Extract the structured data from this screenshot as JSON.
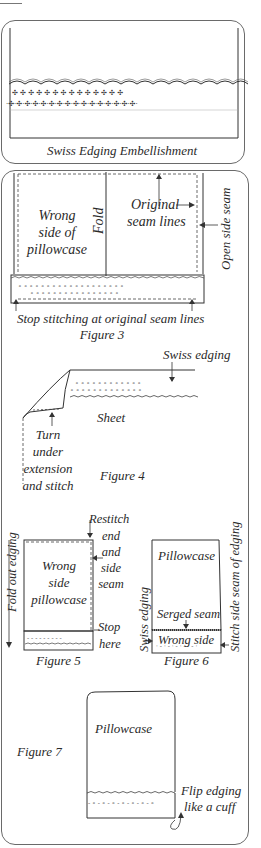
{
  "panel1": {
    "caption": "Swiss Edging Embellishment"
  },
  "figure3": {
    "label_wrong_side": "Wrong\nside of\npillowcase",
    "label_fold": "Fold",
    "label_original": "Original",
    "label_seam_lines": "seam lines",
    "label_open_side_seam": "Open side seam",
    "label_stop_stitching": "Stop stitching at original seam lines",
    "caption": "Figure 3"
  },
  "figure4": {
    "label_swiss_edging": "Swiss edging",
    "label_sheet": "Sheet",
    "label_turn": "Turn",
    "label_under": "under",
    "label_extension": "extension",
    "label_and_stitch": "and stitch",
    "caption": "Figure 4"
  },
  "figure5": {
    "label_restitch": "Restitch",
    "label_end": "end",
    "label_and": "and",
    "label_side": "side",
    "label_seam": "seam",
    "label_stop": "Stop",
    "label_here": "here",
    "label_wrong": "Wrong",
    "label_side2": "side",
    "label_pillowcase": "pillowcase",
    "label_fold_out": "Fold out edging",
    "caption": "Figure 5"
  },
  "figure6": {
    "label_pillowcase": "Pillowcase",
    "label_serged_seam": "Serged seam",
    "label_wrong_side": "Wrong side",
    "label_swiss_edging": "Swiss edging",
    "label_stitch_side": "Stitch side seam of edging",
    "caption": "Figure 6"
  },
  "figure7": {
    "label_pillowcase": "Pillowcase",
    "label_flip": "Flip edging",
    "label_cuff": "like a cuff",
    "caption": "Figure 7"
  },
  "colors": {
    "ink": "#2a2a2a",
    "frame": "#6a6a6a",
    "background": "#ffffff"
  }
}
